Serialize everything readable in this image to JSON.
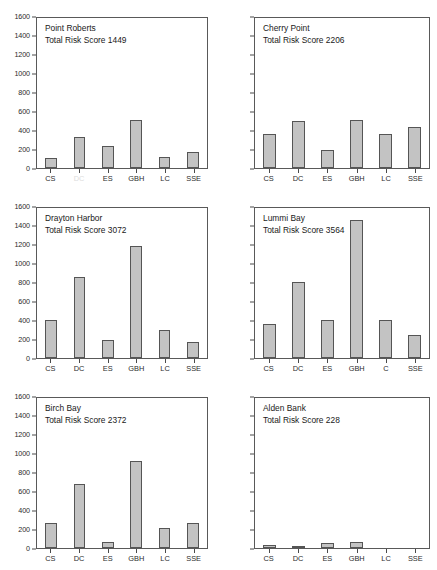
{
  "figure": {
    "name": "risk-score-bar-charts",
    "panel_count": 6
  },
  "axis": {
    "yticks": [
      0,
      200,
      400,
      600,
      800,
      1000,
      1200,
      1400,
      1600
    ],
    "ymin": 0,
    "ymax": 1600
  },
  "chart_data": [
    {
      "type": "bar",
      "title": "Point Roberts",
      "subtitle": "Total Risk Score 1449",
      "total_risk_score": 1449,
      "categories": [
        "CS",
        "DC",
        "ES",
        "GBH",
        "LC",
        "SSE"
      ],
      "values": [
        110,
        330,
        230,
        505,
        115,
        170
      ],
      "xlabel": "",
      "ylabel": "",
      "ylim": [
        0,
        1600
      ],
      "grid": false,
      "show_yticks": true,
      "faded_labels": [
        "DC"
      ]
    },
    {
      "type": "bar",
      "title": "Cherry Point",
      "subtitle": "Total Risk Score 2206",
      "total_risk_score": 2206,
      "categories": [
        "CS",
        "DC",
        "ES",
        "GBH",
        "LC",
        "SSE"
      ],
      "values": [
        360,
        490,
        190,
        510,
        360,
        430
      ],
      "xlabel": "",
      "ylabel": "",
      "ylim": [
        0,
        1600
      ],
      "grid": false,
      "show_yticks": false,
      "faded_labels": []
    },
    {
      "type": "bar",
      "title": "Drayton Harbor",
      "subtitle": "Total Risk Score 3072",
      "total_risk_score": 3072,
      "categories": [
        "CS",
        "DC",
        "ES",
        "GBH",
        "LC",
        "SSE"
      ],
      "values": [
        395,
        855,
        190,
        1180,
        300,
        170
      ],
      "xlabel": "",
      "ylabel": "",
      "ylim": [
        0,
        1600
      ],
      "grid": false,
      "show_yticks": true,
      "faded_labels": []
    },
    {
      "type": "bar",
      "title": "Lummi Bay",
      "subtitle": "Total Risk Score 3564",
      "total_risk_score": 3564,
      "categories": [
        "CS",
        "DC",
        "ES",
        "GBH",
        "C",
        "SSE"
      ],
      "values": [
        360,
        800,
        400,
        1450,
        400,
        240
      ],
      "xlabel": "",
      "ylabel": "",
      "ylim": [
        0,
        1600
      ],
      "grid": false,
      "show_yticks": false,
      "faded_labels": []
    },
    {
      "type": "bar",
      "title": "Birch Bay",
      "subtitle": "Total Risk Score 2372",
      "total_risk_score": 2372,
      "categories": [
        "CS",
        "DC",
        "ES",
        "GBH",
        "LC",
        "SSE"
      ],
      "values": [
        260,
        675,
        65,
        915,
        210,
        260
      ],
      "xlabel": "",
      "ylabel": "",
      "ylim": [
        0,
        1600
      ],
      "grid": false,
      "show_yticks": true,
      "faded_labels": []
    },
    {
      "type": "bar",
      "title": "Alden Bank",
      "subtitle": "Total Risk Score 228",
      "total_risk_score": 228,
      "categories": [
        "CS",
        "DC",
        "ES",
        "GBH",
        "LC",
        "SSE"
      ],
      "values": [
        30,
        25,
        55,
        65,
        0,
        0
      ],
      "xlabel": "",
      "ylabel": "",
      "ylim": [
        0,
        1600
      ],
      "grid": false,
      "show_yticks": false,
      "faded_labels": []
    }
  ],
  "style": {
    "bar_fill": "#c3c3c3",
    "bar_stroke": "#555555",
    "axis_color": "#595959",
    "text_color": "#1a1a1a"
  }
}
